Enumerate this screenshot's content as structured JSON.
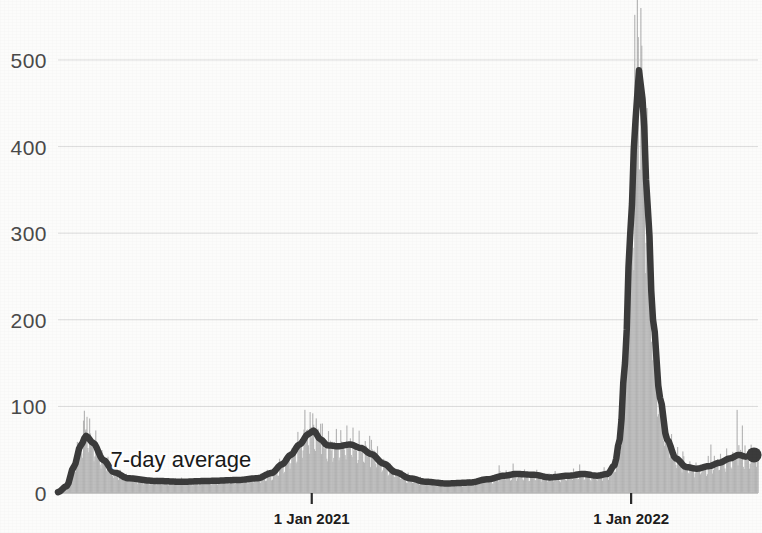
{
  "chart_data": {
    "type": "area",
    "title": "",
    "subtitle": "",
    "xlabel": "",
    "ylabel": "",
    "ylim": [
      0,
      560
    ],
    "grid": true,
    "legend_position": "inline-annotation",
    "annotations": [
      {
        "text": "7-day average",
        "x_index": 60,
        "y_value": 30
      }
    ],
    "y_ticks": [
      {
        "value": 0,
        "label": "0"
      },
      {
        "value": 100,
        "label": "100"
      },
      {
        "value": 200,
        "label": "200"
      },
      {
        "value": 300,
        "label": "300"
      },
      {
        "value": 400,
        "label": "400"
      },
      {
        "value": 500,
        "label": "500"
      }
    ],
    "x_ticks": [
      {
        "label": "1 Jan 2021",
        "x_index": 290
      },
      {
        "label": "1 Jan 2022",
        "x_index": 655
      }
    ],
    "x_range_days": 800,
    "colors": {
      "daily_bars": "#b6b6b6",
      "average_line": "#3b3b3b",
      "gridline": "#dcdcdc",
      "axis_text": "#4a4a4a",
      "background": "#fcfcfb"
    },
    "series": [
      {
        "name": "Daily reported",
        "type": "bar",
        "color": "#b6b6b6",
        "values": [
          1,
          2,
          4,
          7,
          12,
          20,
          30,
          42,
          55,
          62,
          68,
          70,
          66,
          71,
          64,
          60,
          58,
          52,
          48,
          44,
          40,
          36,
          33,
          30,
          28,
          26,
          24,
          22,
          21,
          20,
          19,
          18,
          18,
          17,
          17,
          16,
          16,
          16,
          15,
          15,
          15,
          14,
          14,
          14,
          13,
          13,
          13,
          13,
          12,
          12,
          12,
          12,
          12,
          12,
          11,
          11,
          11,
          11,
          11,
          11,
          11,
          12,
          12,
          12,
          12,
          12,
          13,
          13,
          13,
          13,
          13,
          14,
          14,
          14,
          14,
          14,
          14,
          15,
          15,
          15,
          15,
          15,
          15,
          16,
          16,
          16,
          16,
          16,
          16,
          16,
          17,
          17,
          17,
          17,
          17,
          18,
          18,
          19,
          20,
          21,
          22,
          24,
          26,
          28,
          31,
          34,
          38,
          41,
          44,
          47,
          50,
          53,
          56,
          58,
          61,
          64,
          67,
          70,
          73,
          76,
          74,
          71,
          68,
          65,
          62,
          60,
          58,
          57,
          56,
          55,
          55,
          55,
          54,
          54,
          54,
          55,
          55,
          56,
          56,
          55,
          54,
          53,
          52,
          51,
          50,
          48,
          46,
          44,
          42,
          39,
          36,
          33,
          30,
          27,
          25,
          23,
          21,
          19,
          18,
          17,
          16,
          15,
          15,
          14,
          14,
          13,
          13,
          12,
          12,
          12,
          11,
          11,
          11,
          10,
          10,
          10,
          10,
          10,
          10,
          11,
          11,
          12,
          12,
          13,
          14,
          15,
          16,
          17,
          18,
          19,
          20,
          20,
          21,
          21,
          21,
          22,
          22,
          22,
          22,
          22,
          21,
          21,
          20,
          20,
          19,
          19,
          18,
          18,
          18,
          18,
          18,
          19,
          19,
          20,
          20,
          21,
          21,
          22,
          22,
          22,
          22,
          21,
          21,
          20,
          20,
          20,
          20,
          21,
          22,
          24,
          27,
          32,
          42,
          60,
          90,
          140,
          210,
          300,
          390,
          460,
          495,
          520,
          470,
          400,
          330,
          260,
          200,
          150,
          110,
          85,
          68,
          56,
          48,
          42,
          38,
          35,
          33,
          31,
          30,
          29,
          28,
          28,
          28,
          29,
          30,
          31,
          33,
          34,
          36,
          38,
          40,
          42,
          44,
          46,
          47,
          46,
          45,
          44,
          43,
          44,
          45,
          46,
          45,
          44,
          43,
          44
        ]
      },
      {
        "name": "7-day average",
        "type": "line",
        "color": "#3b3b3b",
        "end_marker": true,
        "key_points": [
          {
            "x_index": 0,
            "value": 1
          },
          {
            "x_index": 10,
            "value": 8
          },
          {
            "x_index": 18,
            "value": 30
          },
          {
            "x_index": 26,
            "value": 55
          },
          {
            "x_index": 32,
            "value": 66
          },
          {
            "x_index": 40,
            "value": 58
          },
          {
            "x_index": 52,
            "value": 38
          },
          {
            "x_index": 64,
            "value": 24
          },
          {
            "x_index": 80,
            "value": 17
          },
          {
            "x_index": 110,
            "value": 14
          },
          {
            "x_index": 140,
            "value": 13
          },
          {
            "x_index": 175,
            "value": 14
          },
          {
            "x_index": 205,
            "value": 15
          },
          {
            "x_index": 228,
            "value": 17
          },
          {
            "x_index": 244,
            "value": 23
          },
          {
            "x_index": 256,
            "value": 33
          },
          {
            "x_index": 266,
            "value": 44
          },
          {
            "x_index": 276,
            "value": 56
          },
          {
            "x_index": 286,
            "value": 68
          },
          {
            "x_index": 292,
            "value": 72
          },
          {
            "x_index": 300,
            "value": 62
          },
          {
            "x_index": 308,
            "value": 55
          },
          {
            "x_index": 320,
            "value": 54
          },
          {
            "x_index": 334,
            "value": 56
          },
          {
            "x_index": 346,
            "value": 52
          },
          {
            "x_index": 358,
            "value": 45
          },
          {
            "x_index": 372,
            "value": 34
          },
          {
            "x_index": 386,
            "value": 24
          },
          {
            "x_index": 402,
            "value": 17
          },
          {
            "x_index": 420,
            "value": 13
          },
          {
            "x_index": 444,
            "value": 11
          },
          {
            "x_index": 470,
            "value": 12
          },
          {
            "x_index": 492,
            "value": 16
          },
          {
            "x_index": 510,
            "value": 20
          },
          {
            "x_index": 524,
            "value": 22
          },
          {
            "x_index": 544,
            "value": 21
          },
          {
            "x_index": 562,
            "value": 18
          },
          {
            "x_index": 584,
            "value": 20
          },
          {
            "x_index": 600,
            "value": 22
          },
          {
            "x_index": 616,
            "value": 20
          },
          {
            "x_index": 628,
            "value": 22
          },
          {
            "x_index": 636,
            "value": 32
          },
          {
            "x_index": 642,
            "value": 62
          },
          {
            "x_index": 648,
            "value": 150
          },
          {
            "x_index": 654,
            "value": 300
          },
          {
            "x_index": 660,
            "value": 430
          },
          {
            "x_index": 664,
            "value": 488
          },
          {
            "x_index": 668,
            "value": 455
          },
          {
            "x_index": 674,
            "value": 330
          },
          {
            "x_index": 680,
            "value": 200
          },
          {
            "x_index": 688,
            "value": 110
          },
          {
            "x_index": 696,
            "value": 62
          },
          {
            "x_index": 706,
            "value": 40
          },
          {
            "x_index": 718,
            "value": 30
          },
          {
            "x_index": 730,
            "value": 28
          },
          {
            "x_index": 744,
            "value": 31
          },
          {
            "x_index": 756,
            "value": 35
          },
          {
            "x_index": 768,
            "value": 40
          },
          {
            "x_index": 778,
            "value": 44
          },
          {
            "x_index": 786,
            "value": 42
          },
          {
            "x_index": 794,
            "value": 44
          },
          {
            "x_index": 800,
            "value": 44
          }
        ]
      }
    ],
    "daily_spikes": [
      {
        "x_index": 30,
        "value": 95
      },
      {
        "x_index": 33,
        "value": 88
      },
      {
        "x_index": 282,
        "value": 96
      },
      {
        "x_index": 291,
        "value": 92
      },
      {
        "x_index": 300,
        "value": 80
      },
      {
        "x_index": 318,
        "value": 74
      },
      {
        "x_index": 330,
        "value": 78
      },
      {
        "x_index": 344,
        "value": 72
      },
      {
        "x_index": 356,
        "value": 66
      },
      {
        "x_index": 504,
        "value": 32
      },
      {
        "x_index": 520,
        "value": 34
      },
      {
        "x_index": 596,
        "value": 33
      },
      {
        "x_index": 662,
        "value": 600
      },
      {
        "x_index": 666,
        "value": 560
      },
      {
        "x_index": 714,
        "value": 48
      },
      {
        "x_index": 746,
        "value": 56
      },
      {
        "x_index": 776,
        "value": 96
      },
      {
        "x_index": 782,
        "value": 78
      }
    ]
  },
  "plot": {
    "left": 58,
    "right": 758,
    "top": 8,
    "bottom": 493
  }
}
